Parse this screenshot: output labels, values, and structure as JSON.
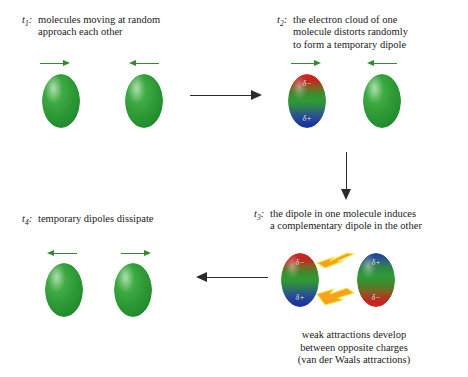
{
  "figure": {
    "title": "Formation of temporary dipoles and van der Waals attractions"
  },
  "steps": [
    {
      "id": "t1",
      "label": "t",
      "sub": "1",
      "colon": ":",
      "lines": [
        "molecules moving at random",
        "approach each other"
      ],
      "molecules": [
        {
          "type": "green",
          "arrow": "right",
          "charges": []
        },
        {
          "type": "green",
          "arrow": "left",
          "charges": []
        }
      ]
    },
    {
      "id": "t2",
      "label": "t",
      "sub": "2",
      "colon": ":",
      "lines": [
        "the electron cloud of one",
        "molecule distorts randomly",
        "to form a temporary dipole"
      ],
      "molecules": [
        {
          "type": "dipole-rb",
          "arrow": "right",
          "charges": [
            "δ−",
            "δ+"
          ]
        },
        {
          "type": "green",
          "arrow": "left",
          "charges": []
        }
      ]
    },
    {
      "id": "t3",
      "label": "t",
      "sub": "3",
      "colon": ":",
      "lines": [
        "the dipole in one molecule induces",
        "a complementary dipole in the other"
      ],
      "molecules": [
        {
          "type": "dipole-rb",
          "arrow": "none",
          "charges": [
            "δ−",
            "δ+"
          ]
        },
        {
          "type": "dipole-br",
          "arrow": "none",
          "charges": [
            "δ+",
            "δ−"
          ]
        }
      ],
      "note": [
        "weak attractions develop",
        "between opposite charges",
        "(van der Waals attractions)"
      ]
    },
    {
      "id": "t4",
      "label": "t",
      "sub": "4",
      "colon": ":",
      "lines": [
        "temporary dipoles dissipate"
      ],
      "molecules": [
        {
          "type": "green",
          "arrow": "left",
          "charges": []
        },
        {
          "type": "green",
          "arrow": "right",
          "charges": []
        }
      ]
    }
  ],
  "flow_arrows": [
    {
      "name": "arrow-t1-to-t2",
      "direction": "right"
    },
    {
      "name": "arrow-t2-to-t3",
      "direction": "down"
    },
    {
      "name": "arrow-t3-to-t4",
      "direction": "left"
    }
  ],
  "colors": {
    "molecule_green": "#2e9b36",
    "negative_red": "#cf2222",
    "positive_blue": "#1e3f9b",
    "velocity_arrow": "#2e8b32",
    "flow_arrow": "#2b2b2b",
    "bolt_orange": "#f5a21e",
    "bolt_yellow": "#fbe84a",
    "background": "#ffffff"
  }
}
